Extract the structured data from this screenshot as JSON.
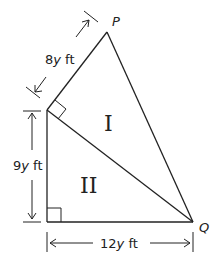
{
  "diagram": {
    "vertices": {
      "P": {
        "label": "P"
      },
      "Q": {
        "label": "Q"
      }
    },
    "regions": {
      "I": {
        "label": "I"
      },
      "II": {
        "label": "II"
      }
    },
    "dimensions": {
      "top_side": {
        "label_num": "8",
        "label_var": "y",
        "label_unit": " ft"
      },
      "left_side": {
        "label_num": "9",
        "label_var": "y",
        "label_unit": " ft"
      },
      "bottom_side": {
        "label_num": "12",
        "label_var": "y",
        "label_unit": " ft"
      }
    },
    "colors": {
      "stroke": "#222222",
      "text": "#222222"
    }
  }
}
